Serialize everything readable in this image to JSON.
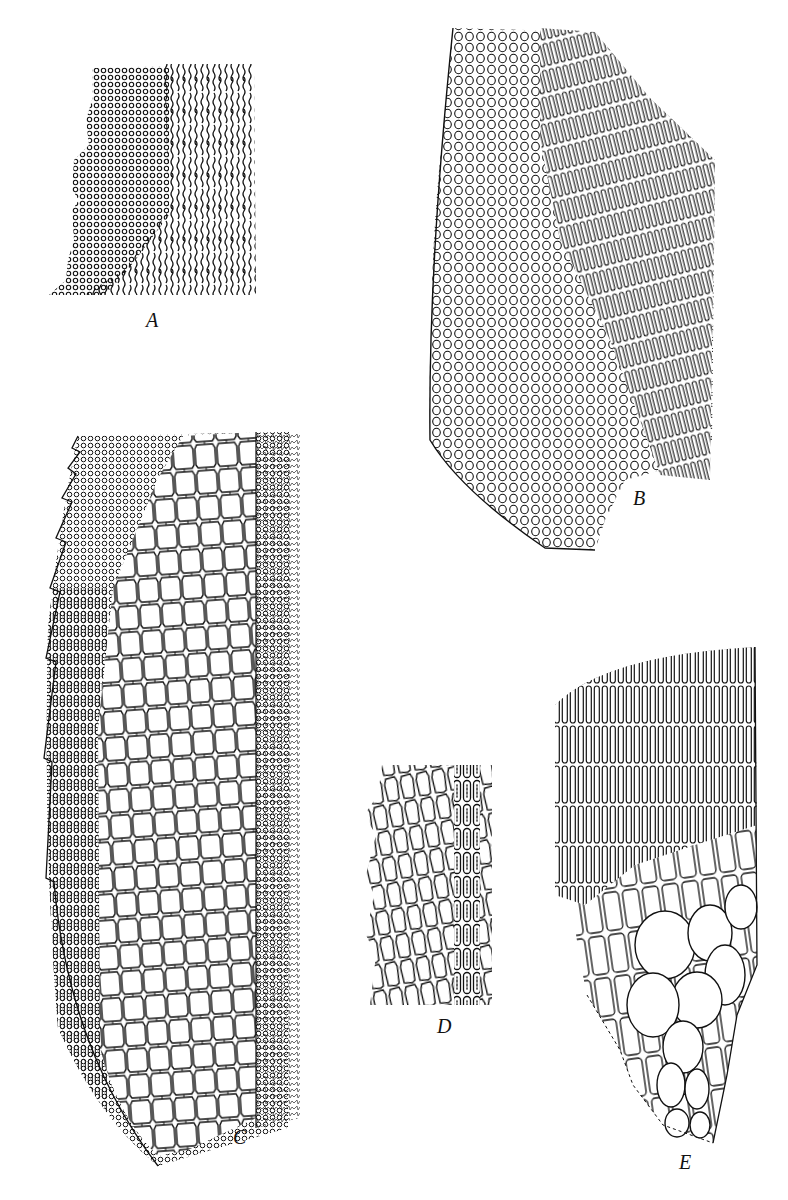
{
  "figure": {
    "type": "botanical line illustration (leaf cell networks)",
    "ink_color": "#111111",
    "background": "#ffffff",
    "panels": [
      {
        "id": "A",
        "label": "A",
        "description": "Leaf margin with small rounded cells at left grading into elongate sinuous cells at right"
      },
      {
        "id": "B",
        "label": "B",
        "description": "Leaf base region: rounded quadrate cells along margin grading to elongate linear cells toward right"
      },
      {
        "id": "C",
        "label": "C",
        "description": "Leaf base with spinose toothed margin, small cells above, large rectangular alar-like cells in center, papillose edge at right"
      },
      {
        "id": "D",
        "label": "D",
        "description": "Mid-leaf cells with costa strip of elongate cells containing chloroplast markings"
      },
      {
        "id": "E",
        "label": "E",
        "description": "Alar region: elongate linear cells above, enlarged inflated rounded alar cells at lower basal corner"
      }
    ]
  }
}
